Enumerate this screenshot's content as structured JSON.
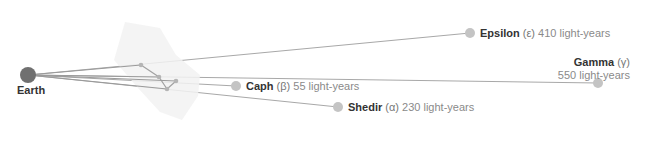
{
  "diagram": {
    "origin": {
      "name": "Earth",
      "x": 28,
      "y": 75,
      "r": 8,
      "color": "#707070"
    },
    "constellation": {
      "region_color": "#f2f2f2",
      "region_polygon": "125,22 160,28 176,55 200,75 198,96 182,120 160,112 138,88 114,60",
      "stars": [
        {
          "x": 141,
          "y": 65
        },
        {
          "x": 159,
          "y": 77
        },
        {
          "x": 176,
          "y": 81
        },
        {
          "x": 167,
          "y": 89
        }
      ],
      "links": [
        [
          0,
          1
        ],
        [
          1,
          3
        ],
        [
          3,
          2
        ]
      ]
    },
    "stars": [
      {
        "name": "Caph",
        "greek": "(β)",
        "distance": "55 light-years",
        "x": 236,
        "y": 86,
        "r": 5
      },
      {
        "name": "Shedir",
        "greek": "(α)",
        "distance": "230 light-years",
        "x": 338,
        "y": 107,
        "r": 5
      },
      {
        "name": "Epsilon",
        "greek": "(ε)",
        "distance": "410 light-years",
        "x": 470,
        "y": 33,
        "r": 5
      },
      {
        "name": "Gamma",
        "greek": "(γ)",
        "distance": "550 light-years",
        "x": 598,
        "y": 83,
        "r": 5
      }
    ],
    "colors": {
      "line": "#a8a8a8",
      "star": "#c4c4c4",
      "constellation_star": "#b5b5b5"
    }
  },
  "labels": {
    "earth": "Earth",
    "caph": {
      "name": "Caph",
      "greek": "(β)",
      "distance": "55 light-years"
    },
    "shedir": {
      "name": "Shedir",
      "greek": "(α)",
      "distance": "230 light-years"
    },
    "epsilon": {
      "name": "Epsilon",
      "greek": "(ε)",
      "distance": "410 light-years"
    },
    "gamma": {
      "name": "Gamma",
      "greek": "(γ)",
      "distance": "550 light-years"
    }
  }
}
